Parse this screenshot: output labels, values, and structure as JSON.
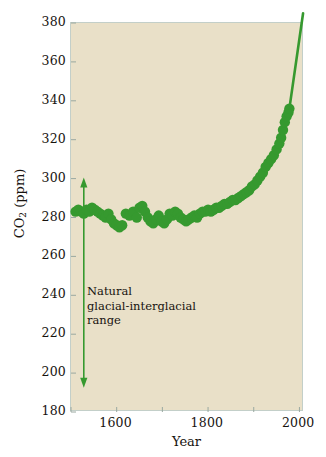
{
  "figure": {
    "background_color": "#ffffff",
    "plot_background_color": "#e9e0c8",
    "accent_color": "#36992f",
    "frame_color": "#c3cfc9",
    "text_color": "#17130f"
  },
  "annotation": {
    "line1": "Natural",
    "line2": "glacial-interglacial",
    "line3": "range",
    "arrow_top_ppm": 300,
    "arrow_bottom_ppm": 193
  },
  "chart_data": {
    "type": "scatter",
    "title": "",
    "subtitle": "",
    "xlabel": "Year",
    "ylabel": "CO2 (ppm)",
    "ylabel_display": "CO",
    "ylabel_sub": "2",
    "ylabel_unit": " (ppm)",
    "xlim": [
      1500,
      2010
    ],
    "ylim": [
      180,
      380
    ],
    "grid": false,
    "legend": null,
    "ytick_labels": [
      "380",
      "360",
      "340",
      "320",
      "300",
      "280",
      "260",
      "240",
      "220",
      "200",
      "180"
    ],
    "ytick_values": [
      380,
      360,
      340,
      320,
      300,
      280,
      260,
      240,
      220,
      200,
      180
    ],
    "xtick_labels": [
      "1600",
      "1800",
      "2000"
    ],
    "xtick_values": [
      1600,
      1800,
      2000
    ],
    "minor_xtick_values": [
      1500,
      1700,
      1900
    ],
    "series": [
      {
        "name": "Atmospheric CO2 (ice core + direct)",
        "marker": "circle",
        "color": "#36992f",
        "x": [
          1510,
          1516,
          1522,
          1528,
          1534,
          1540,
          1546,
          1552,
          1558,
          1564,
          1570,
          1576,
          1582,
          1588,
          1594,
          1600,
          1606,
          1612,
          1620,
          1628,
          1636,
          1644,
          1650,
          1656,
          1662,
          1668,
          1674,
          1680,
          1686,
          1692,
          1698,
          1704,
          1710,
          1716,
          1722,
          1728,
          1734,
          1740,
          1746,
          1752,
          1758,
          1764,
          1770,
          1776,
          1782,
          1788,
          1794,
          1800,
          1806,
          1812,
          1818,
          1824,
          1830,
          1836,
          1842,
          1848,
          1854,
          1860,
          1866,
          1872,
          1878,
          1884,
          1890,
          1896,
          1902,
          1908,
          1914,
          1920,
          1926,
          1932,
          1938,
          1944,
          1950,
          1956,
          1960,
          1964,
          1968,
          1972,
          1976,
          1978
        ],
        "y": [
          283,
          284,
          283,
          282,
          284,
          283,
          285,
          284,
          283,
          282,
          281,
          280,
          282,
          279,
          277,
          276,
          275,
          276,
          282,
          281,
          283,
          280,
          285,
          286,
          283,
          280,
          278,
          277,
          279,
          281,
          278,
          277,
          279,
          282,
          281,
          283,
          282,
          280,
          279,
          278,
          279,
          280,
          281,
          280,
          282,
          283,
          283,
          284,
          283,
          284,
          285,
          285,
          286,
          287,
          287,
          288,
          289,
          289,
          290,
          291,
          292,
          293,
          294,
          296,
          297,
          299,
          301,
          303,
          306,
          308,
          310,
          312,
          315,
          318,
          321,
          325,
          329,
          332,
          334,
          336
        ]
      },
      {
        "name": "Modern direct record extension",
        "marker": "line",
        "color": "#36992f",
        "x": [
          1978,
          2008
        ],
        "y": [
          336,
          385
        ]
      }
    ]
  }
}
